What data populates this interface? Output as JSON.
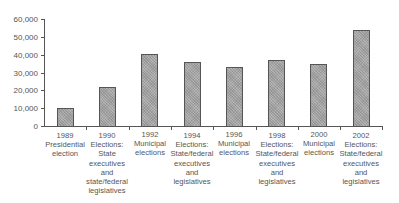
{
  "chart_data": {
    "type": "bar",
    "title": "",
    "xlabel": "",
    "ylabel": "",
    "ylim": [
      0,
      60000
    ],
    "yticks": [
      0,
      10000,
      20000,
      30000,
      40000,
      50000,
      60000
    ],
    "ytick_labels": [
      "0",
      "10,000",
      "20,000",
      "30,000",
      "40,000",
      "50,000",
      "60,000"
    ],
    "grid": false,
    "legend": null,
    "categories": [
      "1989\nPresidential\nelection",
      "1990\nElections:\nState\nexecutives\nand\nstate/federal\nlegislatives",
      "1992\nMunicipal\nelections",
      "1994\nElections:\nState/federal\nexecutives\nand\nlegislatives",
      "1996\nMunicipal\nelections",
      "1998\nElections:\nState/federal\nexecutives\nand\nlegislatives",
      "2000\nMunicipal\nelections",
      "2002\nElections:\nState/federal\nexecutives\nand\nlegislatives"
    ],
    "values": [
      10000,
      22000,
      40500,
      35800,
      33000,
      36800,
      34800,
      54000
    ],
    "bar_color": "#a8a8a8"
  }
}
